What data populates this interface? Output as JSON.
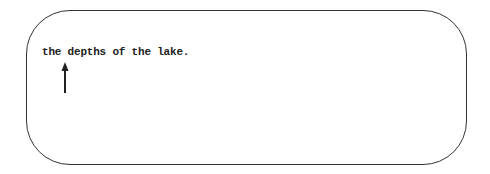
{
  "diagram": {
    "text_line": "the depths of the lake.",
    "arrow": {
      "direction": "up",
      "points_to": "d"
    },
    "colors": {
      "stroke": "#333333",
      "text": "#222222",
      "background": "#ffffff"
    }
  }
}
